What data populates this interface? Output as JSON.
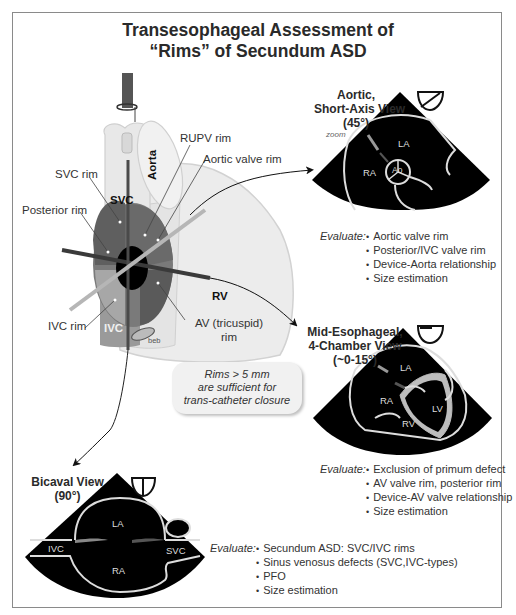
{
  "title": {
    "line1": "Transesophageal Assessment of",
    "line2": "“Rims” of Secundum ASD"
  },
  "heart_diagram": {
    "structure_labels": {
      "svc": "SVC",
      "aorta": "Aorta",
      "rv": "RV",
      "ivc": "IVC",
      "beb": "beb"
    },
    "rim_labels": {
      "rupv_rim": "RUPV rim",
      "aortic_valve_rim": "Aortic valve rim",
      "svc_rim": "SVC rim",
      "posterior_rim": "Posterior rim",
      "ivc_rim": "IVC rim",
      "av_rim_line1": "AV (tricuspid)",
      "av_rim_line2": "rim"
    },
    "colors": {
      "heart_light": "#e6e6e6",
      "heart_outline": "#cfcfcf",
      "septum_dark": "#6e6e6e",
      "septum_mid": "#8c8c8c",
      "defect": "#000000",
      "probe_dark": "#3a3a3a",
      "probe_light": "#b4b4b4"
    }
  },
  "note": {
    "line1": "Rims > 5 mm",
    "line2": "are sufficient for",
    "line3": "trans-catheter closure"
  },
  "views": {
    "aortic_sax": {
      "title_line1": "Aortic,",
      "title_line2": "Short-Axis View",
      "title_line3": "(45°)",
      "zoom_note": "zoom",
      "chambers": [
        "LA",
        "RA",
        "Ao"
      ],
      "evaluate_label": "Evaluate:",
      "evaluate_items": [
        "Aortic valve rim",
        "Posterior/IVC valve rim",
        "Device-Aorta relationship",
        "Size estimation"
      ]
    },
    "four_chamber": {
      "title_line1": "Mid-Esophageal,",
      "title_line2": "4-Chamber View",
      "title_line3": "(~0-15°)",
      "chambers": [
        "LA",
        "RA",
        "LV",
        "RV"
      ],
      "evaluate_label": "Evaluate:",
      "evaluate_items": [
        "Exclusion of primum defect",
        "AV valve rim, posterior rim",
        "Device-AV valve relationship",
        "Size estimation"
      ]
    },
    "bicaval": {
      "title_line1": "Bicaval View",
      "title_line2": "(90°)",
      "chambers": [
        "LA",
        "RA",
        "IVC",
        "SVC"
      ],
      "evaluate_label": "Evaluate:",
      "evaluate_items": [
        "Secundum ASD: SVC/IVC rims",
        "Sinus venosus defects (SVC,IVC-types)",
        "PFO",
        "Size estimation"
      ]
    }
  }
}
